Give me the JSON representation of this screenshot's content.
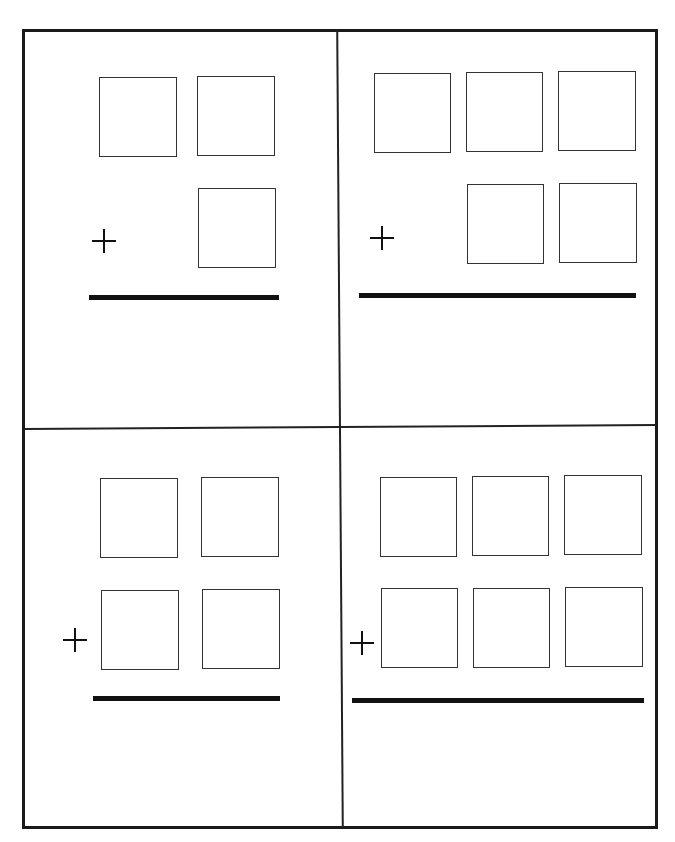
{
  "worksheet": {
    "type": "addition-worksheet",
    "operator_symbol": "+",
    "problems": [
      {
        "id": 1,
        "top_digits": 2,
        "bottom_digits": 1,
        "operator": "+"
      },
      {
        "id": 2,
        "top_digits": 3,
        "bottom_digits": 2,
        "operator": "+"
      },
      {
        "id": 3,
        "top_digits": 2,
        "bottom_digits": 2,
        "operator": "+"
      },
      {
        "id": 4,
        "top_digits": 3,
        "bottom_digits": 3,
        "operator": "+"
      }
    ]
  },
  "colors": {
    "ink": "#111111",
    "background": "#ffffff"
  }
}
